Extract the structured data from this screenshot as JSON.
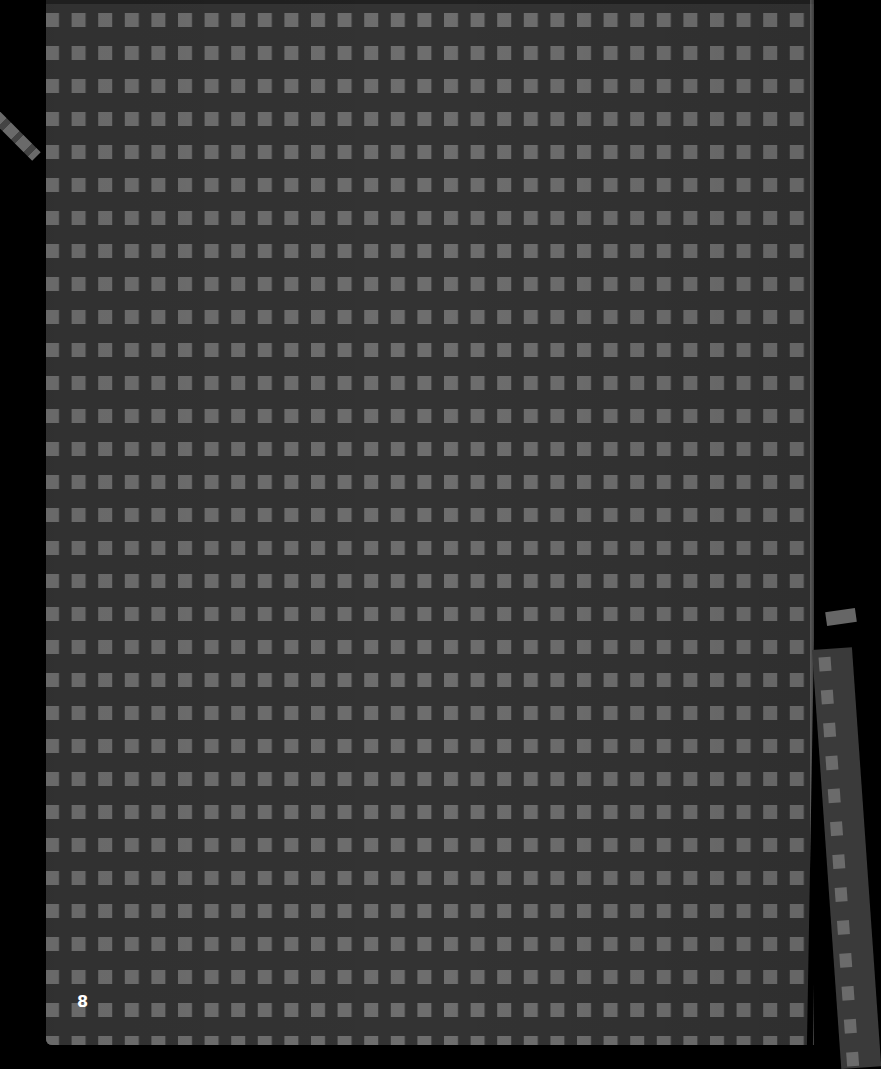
{
  "document": {
    "type": "scanned-page",
    "background_color": "#000000",
    "sheet": {
      "base_color": "#333333",
      "square_color": "#6e6e6e",
      "pattern": "grid-of-squares",
      "square_size_px": 14,
      "column_pitch_px": 26.6,
      "row_pitch_px": 33,
      "columns": 29,
      "rows": 32
    },
    "page_number": "8"
  }
}
